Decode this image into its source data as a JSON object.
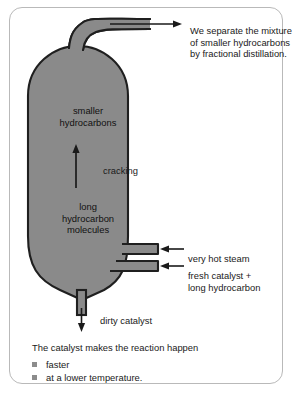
{
  "diagram": {
    "vessel": {
      "fill_color": "#8a8a8a",
      "stroke_color": "#1f1f1f",
      "labels": {
        "top_contents": "smaller\nhydrocarbons",
        "bottom_contents": "long\nhydrocarbon\nmolecules",
        "process_arrow": "cracking"
      }
    },
    "annotations": {
      "top_outlet": "We separate the mixture of smaller hydrocarbons by fractional distillation.",
      "inlet_upper": "very hot steam",
      "inlet_lower": "fresh catalyst +\nlong hydrocarbon",
      "bottom_outlet": "dirty catalyst"
    }
  },
  "footer": {
    "heading": "The catalyst makes the reaction happen",
    "bullets": [
      "faster",
      "at a lower temperature."
    ],
    "bullet_color": "#8c8c8c"
  }
}
